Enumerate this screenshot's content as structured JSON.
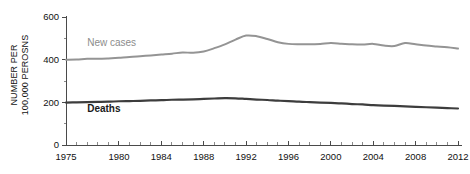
{
  "chart_data": {
    "type": "line",
    "title": "",
    "subtitle": "",
    "xlabel": "",
    "ylabel": "NUMBER PER 100,000 PEROSNS",
    "ylabel_lines": [
      "NUMBER PER",
      "100,000 PEROSNS"
    ],
    "xlim": [
      1975,
      2012
    ],
    "ylim": [
      0,
      600
    ],
    "y_ticks": [
      0,
      200,
      400,
      600
    ],
    "y_tick_labels": [
      "0",
      "200",
      "400",
      "600"
    ],
    "y_minor_ticks": [
      100,
      300,
      500
    ],
    "x_ticks": [
      1975,
      1980,
      1984,
      1988,
      1992,
      1996,
      2000,
      2004,
      2008,
      2012
    ],
    "x_tick_labels": [
      "1975",
      "1980",
      "1984",
      "1988",
      "1992",
      "1996",
      "2000",
      "2004",
      "2008",
      "2012"
    ],
    "x_minor_tick_step": 1,
    "grid": false,
    "legend_position": "inline-annotations",
    "x": [
      1975,
      1976,
      1977,
      1978,
      1979,
      1980,
      1981,
      1982,
      1983,
      1984,
      1985,
      1986,
      1987,
      1988,
      1989,
      1990,
      1991,
      1992,
      1993,
      1994,
      1995,
      1996,
      1997,
      1998,
      1999,
      2000,
      2001,
      2002,
      2003,
      2004,
      2005,
      2006,
      2007,
      2008,
      2009,
      2010,
      2011,
      2012
    ],
    "series": [
      {
        "name": "New cases",
        "color": "#949494",
        "width": 2.0,
        "label_x": 1977.0,
        "label_y": 466,
        "values": [
          400,
          401,
          404,
          404,
          406,
          409,
          412,
          416,
          420,
          424,
          428,
          434,
          432,
          438,
          454,
          472,
          494,
          513,
          510,
          497,
          482,
          474,
          472,
          472,
          474,
          478,
          475,
          472,
          471,
          474,
          466,
          464,
          478,
          472,
          466,
          462,
          458,
          452
        ]
      },
      {
        "name": "Deaths",
        "color": "#3d3d3d",
        "width": 2.2,
        "label_x": 1977.0,
        "label_y": 154,
        "values": [
          199,
          200,
          201,
          202,
          203,
          205,
          206,
          207,
          209,
          210,
          212,
          213,
          214,
          216,
          218,
          220,
          219,
          216,
          213,
          211,
          208,
          206,
          203,
          201,
          199,
          197,
          195,
          192,
          190,
          187,
          185,
          183,
          181,
          179,
          177,
          175,
          173,
          171
        ]
      }
    ]
  },
  "axes": {
    "origin_label": "0"
  }
}
